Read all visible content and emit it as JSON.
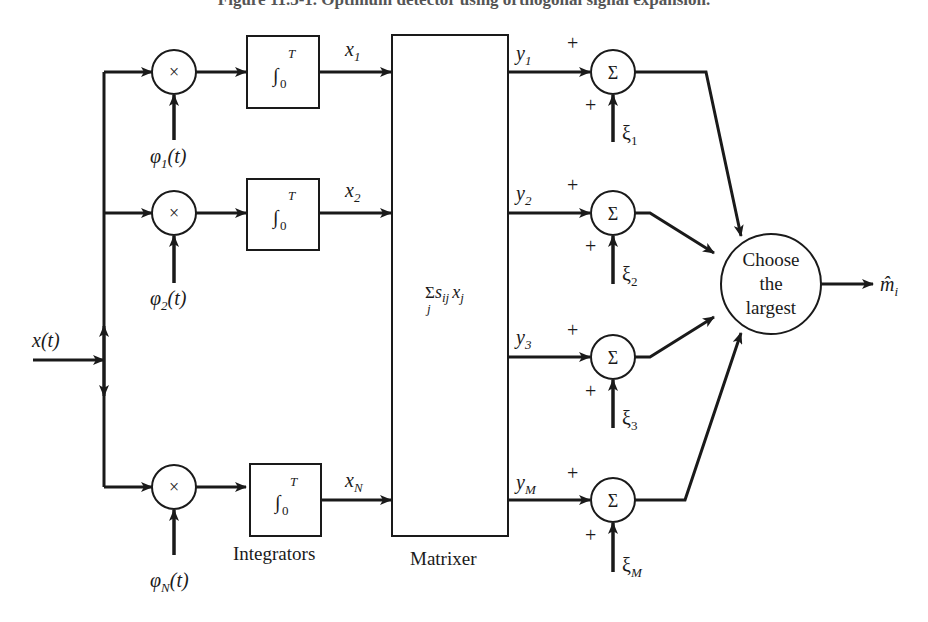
{
  "figure": {
    "title": "Figure 11.5-1. Optimum detector using orthogonal signal expansion."
  },
  "input": {
    "label": "x(t)"
  },
  "branches": [
    {
      "multiplier_symbol": "×",
      "basis_label": "φ",
      "basis_sub": "1",
      "basis_arg": "(t)",
      "integrator": "∫",
      "int_lower": "0",
      "int_upper": "T",
      "output_label": "x",
      "output_sub": "1"
    },
    {
      "multiplier_symbol": "×",
      "basis_label": "φ",
      "basis_sub": "2",
      "basis_arg": "(t)",
      "integrator": "∫",
      "int_lower": "0",
      "int_upper": "T",
      "output_label": "x",
      "output_sub": "2"
    },
    {
      "multiplier_symbol": "×",
      "basis_label": "φ",
      "basis_sub": "N",
      "basis_arg": "(t)",
      "integrator": "∫",
      "int_lower": "0",
      "int_upper": "T",
      "output_label": "x",
      "output_sub": "N"
    }
  ],
  "integrators_caption": "Integrators",
  "matrixer": {
    "caption": "Matrixer",
    "formula_sigma": "Σ",
    "formula_sigma_sub": "j",
    "formula_s": "s",
    "formula_s_sub": "ij",
    "formula_x": "x",
    "formula_x_sub": "j"
  },
  "adders": [
    {
      "in_label": "y",
      "in_sub": "1",
      "plus_top": "+",
      "plus_bottom": "+",
      "symbol": "Σ",
      "bias_label": "ξ",
      "bias_sub": "1"
    },
    {
      "in_label": "y",
      "in_sub": "2",
      "plus_top": "+",
      "plus_bottom": "+",
      "symbol": "Σ",
      "bias_label": "ξ",
      "bias_sub": "2"
    },
    {
      "in_label": "y",
      "in_sub": "3",
      "plus_top": "+",
      "plus_bottom": "+",
      "symbol": "Σ",
      "bias_label": "ξ",
      "bias_sub": "3"
    },
    {
      "in_label": "y",
      "in_sub": "M",
      "plus_top": "+",
      "plus_bottom": "+",
      "symbol": "Σ",
      "bias_label": "ξ",
      "bias_sub": "M"
    }
  ],
  "decision": {
    "line1": "Choose",
    "line2": "the",
    "line3": "largest",
    "output_label": "m̂",
    "output_sub": "i"
  }
}
